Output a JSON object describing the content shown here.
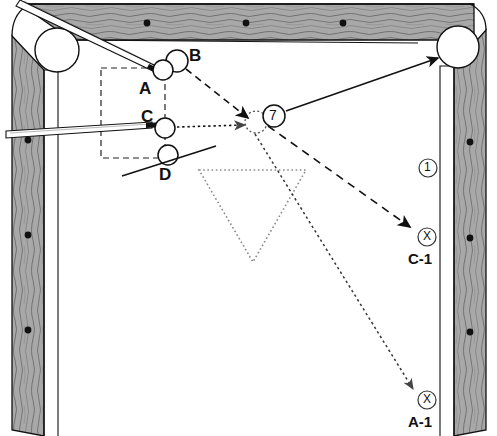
{
  "diagram": {
    "type": "billiards-table-top-down",
    "table": {
      "rail_color": "#9b9b9b",
      "cloth_color": "#ffffff",
      "outline_color": "#000000",
      "rails": [
        "top",
        "left",
        "right"
      ],
      "diamonds": {
        "top": [
          147,
          246,
          343
        ],
        "left": [
          140,
          235,
          330
        ],
        "right": [
          142,
          238,
          332
        ]
      },
      "pockets": [
        {
          "name": "top-left-pocket",
          "cx": 57,
          "cy": 50,
          "r": 22
        },
        {
          "name": "top-right-pocket",
          "cx": 458,
          "cy": 47,
          "r": 21
        }
      ]
    },
    "balls": [
      {
        "id": "A",
        "label": "A",
        "cx": 163,
        "cy": 70,
        "r": 10,
        "label_x": 139,
        "label_y": 80
      },
      {
        "id": "B",
        "label": "B",
        "cx": 177,
        "cy": 61,
        "r": 11,
        "label_x": 189,
        "label_y": 54
      },
      {
        "id": "C",
        "label": "C",
        "cx": 165,
        "cy": 128,
        "r": 10,
        "label_x": 141,
        "label_y": 110
      },
      {
        "id": "D",
        "label": "D",
        "cx": 168,
        "cy": 155,
        "r": 10,
        "label_x": 159,
        "label_y": 168
      }
    ],
    "object_ball": {
      "id": "7",
      "label": "7",
      "cx": 274,
      "cy": 116,
      "r": 11
    },
    "ghost_ball": {
      "cx": 256,
      "cy": 122,
      "r": 11
    },
    "markers": [
      {
        "id": "one",
        "label": "1",
        "cx": 428,
        "cy": 168,
        "r": 9,
        "style": "circled-number"
      },
      {
        "id": "x-c1",
        "label": "X",
        "cx": 427,
        "cy": 237,
        "r": 9,
        "style": "circled-x",
        "caption": "C-1",
        "caption_x": 425,
        "caption_y": 259
      },
      {
        "id": "x-a1",
        "label": "X",
        "cx": 427,
        "cy": 400,
        "r": 9,
        "style": "circled-x",
        "caption": "A-1",
        "caption_x": 425,
        "caption_y": 422
      }
    ],
    "cue_sticks": [
      {
        "name": "cue-stick-upper",
        "from_x": 22,
        "from_y": 2,
        "to_x": 157,
        "to_y": 68
      },
      {
        "name": "cue-stick-lower",
        "from_x": 8,
        "from_y": 134,
        "to_x": 156,
        "to_y": 126
      }
    ],
    "paths": [
      {
        "name": "path-b-to-ghost",
        "style": "dashed",
        "points": "186,69 253,120",
        "arrow": true
      },
      {
        "name": "path-c-to-ghost",
        "style": "dotted",
        "points": "176,127 250,124",
        "arrow": true
      },
      {
        "name": "path-seven-to-pocket",
        "style": "solid",
        "points": "285,112 441,58",
        "arrow": true
      },
      {
        "name": "path-ghost-to-c1",
        "style": "dashed",
        "points": "267,125 412,228",
        "arrow": true
      },
      {
        "name": "path-ghost-to-a1",
        "style": "dotted",
        "points": "258,133 412,390",
        "arrow": true
      }
    ],
    "guide_box": {
      "name": "alignment-rectangle",
      "style": "dashed",
      "x": 101,
      "y": 68,
      "w": 64,
      "h": 90
    },
    "rack_outline": {
      "name": "triangle-rack-outline",
      "style": "dotted",
      "points": "199,170 306,170 253,262"
    }
  }
}
